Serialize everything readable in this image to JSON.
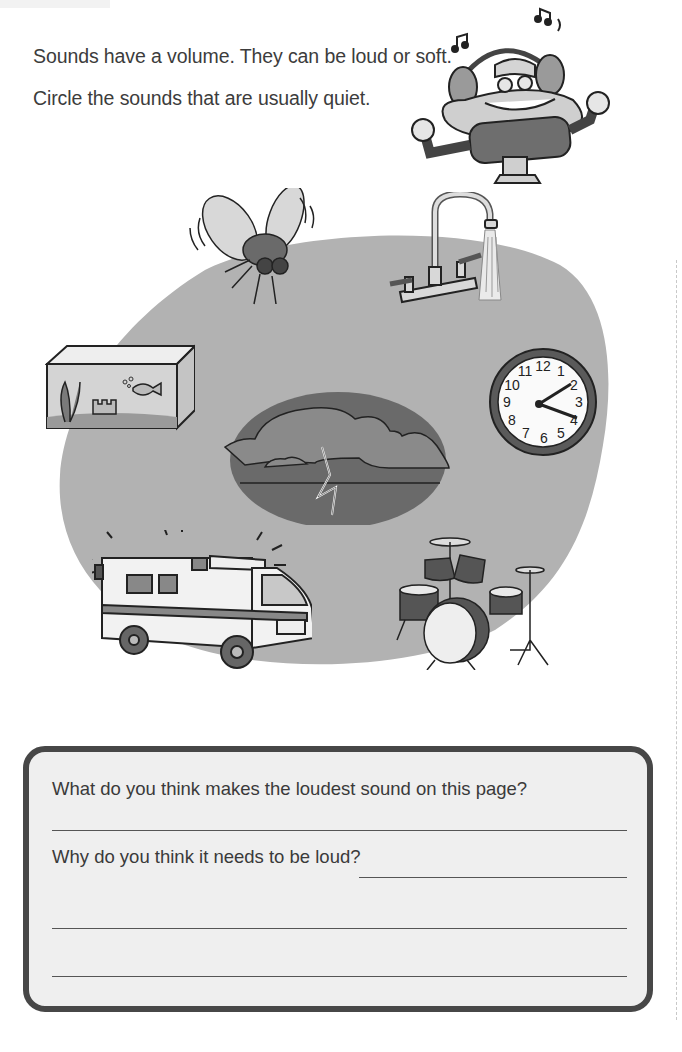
{
  "instructions": {
    "line1": "Sounds have a volume. They can be loud or soft.",
    "line2": "Circle the sounds that are usually quiet."
  },
  "illustrations": [
    {
      "name": "boombox-character",
      "description": "boombox character wearing headphones with music notes"
    },
    {
      "name": "fly",
      "description": "buzzing fly"
    },
    {
      "name": "faucet",
      "description": "running water faucet"
    },
    {
      "name": "fish-tank",
      "description": "aquarium with fish, plant and castle"
    },
    {
      "name": "wall-clock",
      "description": "wall clock",
      "numbers": [
        "12",
        "1",
        "2",
        "3",
        "4",
        "5",
        "6",
        "7",
        "8",
        "9",
        "10",
        "11"
      ]
    },
    {
      "name": "thunderstorm",
      "description": "storm cloud with lightning"
    },
    {
      "name": "ambulance",
      "description": "ambulance with flashing lights"
    },
    {
      "name": "drum-kit",
      "description": "drum set with cymbals"
    }
  ],
  "question_box": {
    "question1": "What do you think makes the loudest sound on this page?",
    "question2": "Why do you think it needs to be loud?"
  },
  "colors": {
    "blob": "#b2b2b2",
    "box_border": "#474747",
    "box_fill": "#efefef",
    "text": "#3a3a3a"
  }
}
